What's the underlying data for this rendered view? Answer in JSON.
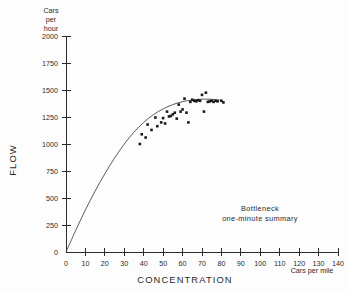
{
  "chart_data": {
    "type": "scatter",
    "title": "",
    "xlabel": "CONCENTRATION",
    "ylabel": "FLOW",
    "x_unit_label": "Cars per mile",
    "y_unit_label": "Cars\nper\nhour",
    "y_unit_lines": [
      "Cars",
      "per",
      "hour"
    ],
    "xlim": [
      0,
      140
    ],
    "ylim": [
      0,
      2000
    ],
    "xticks": [
      0,
      10,
      20,
      30,
      40,
      50,
      60,
      70,
      80,
      90,
      100,
      110,
      120,
      130,
      140
    ],
    "yticks": [
      0,
      250,
      500,
      750,
      1000,
      1250,
      1500,
      1750,
      2000
    ],
    "xtick_labels": [
      "0",
      "10",
      "20",
      "30",
      "40",
      "50",
      "60",
      "70",
      "80",
      "90",
      "100",
      "110",
      "120",
      "130",
      "140"
    ],
    "ytick_labels": [
      "0",
      "250",
      "500",
      "750",
      "1000",
      "1250",
      "1500",
      "1750",
      "2000"
    ],
    "grid": false,
    "legend": "none",
    "annotation_lines": [
      "Bottleneck",
      "one-minute summary"
    ],
    "marker_color": "#1a1a1a",
    "curve_color": "#4a4a4a",
    "axis_color": "#2b2b2b",
    "points": [
      [
        38,
        1000
      ],
      [
        39,
        1090
      ],
      [
        41,
        1060
      ],
      [
        42,
        1180
      ],
      [
        44,
        1130
      ],
      [
        46,
        1245
      ],
      [
        47,
        1165
      ],
      [
        49,
        1200
      ],
      [
        50,
        1240
      ],
      [
        51,
        1190
      ],
      [
        52,
        1300
      ],
      [
        53,
        1255
      ],
      [
        54,
        1260
      ],
      [
        55,
        1275
      ],
      [
        56,
        1290
      ],
      [
        57,
        1235
      ],
      [
        58,
        1365
      ],
      [
        59,
        1300
      ],
      [
        60,
        1320
      ],
      [
        61,
        1420
      ],
      [
        62,
        1290
      ],
      [
        63,
        1200
      ],
      [
        64,
        1390
      ],
      [
        65,
        1410
      ],
      [
        66,
        1400
      ],
      [
        67,
        1395
      ],
      [
        68,
        1405
      ],
      [
        69,
        1400
      ],
      [
        70,
        1455
      ],
      [
        71,
        1300
      ],
      [
        72,
        1475
      ],
      [
        73,
        1390
      ],
      [
        74,
        1395
      ],
      [
        75,
        1400
      ],
      [
        76,
        1390
      ],
      [
        77,
        1400
      ],
      [
        78,
        1395
      ],
      [
        80,
        1400
      ],
      [
        81,
        1385
      ]
    ],
    "fit_curve": [
      [
        0,
        0
      ],
      [
        5,
        200
      ],
      [
        10,
        390
      ],
      [
        15,
        565
      ],
      [
        20,
        725
      ],
      [
        25,
        870
      ],
      [
        30,
        1000
      ],
      [
        35,
        1110
      ],
      [
        40,
        1200
      ],
      [
        45,
        1272
      ],
      [
        50,
        1325
      ],
      [
        55,
        1365
      ],
      [
        60,
        1392
      ],
      [
        65,
        1408
      ],
      [
        70,
        1415
      ],
      [
        75,
        1414
      ],
      [
        80,
        1405
      ]
    ]
  }
}
